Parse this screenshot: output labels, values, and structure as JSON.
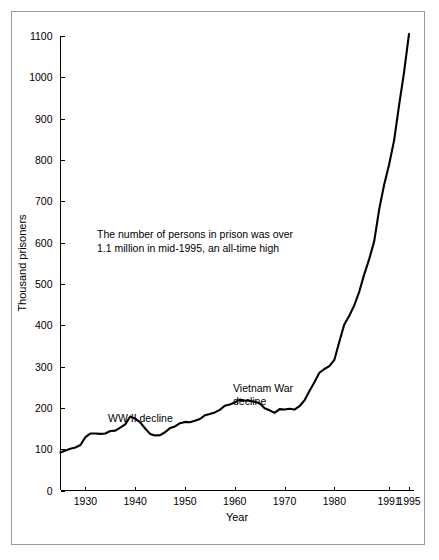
{
  "figure": {
    "background_color": "#ffffff",
    "frame_color": "#9a9a9a",
    "line_color": "#000000"
  },
  "annotations": {
    "callout_line1": "The number of persons in prison was over",
    "callout_line2": "1.1 million in mid-1995, an all-time high",
    "wwii_label": "WW II decline",
    "vietnam_label_line1": "Vietnam War",
    "vietnam_label_line2": "decline"
  },
  "chart_data": {
    "type": "line",
    "title": "",
    "xlabel": "Year",
    "ylabel": "Thousand prisoners",
    "xlim": [
      1925,
      1996
    ],
    "ylim": [
      0,
      1100
    ],
    "grid": false,
    "legend": null,
    "xticks": [
      1930,
      1940,
      1950,
      1960,
      1970,
      1980,
      1991,
      1995
    ],
    "xtick_labels": [
      "1930",
      "1940",
      "1950",
      "1960",
      "1970",
      "1980",
      "1991",
      "1995"
    ],
    "yticks": [
      0,
      100,
      200,
      300,
      400,
      500,
      600,
      700,
      800,
      900,
      1000,
      1100
    ],
    "ytick_labels": [
      "0",
      "100",
      "200",
      "300",
      "400",
      "500",
      "600",
      "700",
      "800",
      "900",
      "1000",
      "1100"
    ],
    "series": [
      {
        "name": "Sentenced prisoners in state and federal institutions",
        "x": [
          1925,
          1926,
          1927,
          1928,
          1929,
          1930,
          1931,
          1932,
          1933,
          1934,
          1935,
          1936,
          1937,
          1938,
          1939,
          1940,
          1941,
          1942,
          1943,
          1944,
          1945,
          1946,
          1947,
          1948,
          1949,
          1950,
          1951,
          1952,
          1953,
          1954,
          1955,
          1956,
          1957,
          1958,
          1959,
          1960,
          1961,
          1962,
          1963,
          1964,
          1965,
          1966,
          1967,
          1968,
          1969,
          1970,
          1971,
          1972,
          1973,
          1974,
          1975,
          1976,
          1977,
          1978,
          1979,
          1980,
          1981,
          1982,
          1983,
          1984,
          1985,
          1986,
          1987,
          1988,
          1989,
          1990,
          1991,
          1992,
          1993,
          1994,
          1995
        ],
        "values": [
          92,
          97,
          101,
          104,
          110,
          129,
          138,
          138,
          137,
          138,
          144,
          145,
          152,
          160,
          179,
          174,
          165,
          150,
          137,
          133,
          134,
          141,
          151,
          155,
          163,
          166,
          165,
          169,
          173,
          182,
          185,
          189,
          195,
          205,
          208,
          213,
          220,
          218,
          217,
          215,
          211,
          199,
          194,
          188,
          197,
          196,
          198,
          196,
          204,
          218,
          241,
          262,
          285,
          294,
          301,
          316,
          360,
          402,
          423,
          448,
          481,
          523,
          560,
          603,
          680,
          740,
          789,
          847,
          932,
          1012,
          1105
        ]
      }
    ],
    "callout_text": "The number of persons in prison was over 1.1 million in mid-1995, an all-time high"
  }
}
